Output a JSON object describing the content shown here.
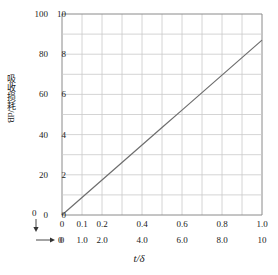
{
  "chart_data": {
    "type": "line",
    "title": "",
    "xlabel": "t/δ",
    "ylabel": "吸收损耗/dB",
    "grid": true,
    "legend": "none",
    "axes": {
      "y_primary": {
        "name": "吸收损耗/dB",
        "min": 0,
        "max": 100,
        "step": 20,
        "ticks": [
          "0",
          "20",
          "40",
          "60",
          "80",
          "100"
        ]
      },
      "y_secondary": {
        "min": 0,
        "max": 10,
        "step": 2,
        "ticks": [
          "0",
          "2",
          "4",
          "6",
          "8",
          "10"
        ]
      },
      "x_primary": {
        "min": 0,
        "max": 1.0,
        "ticks": [
          "0",
          "0.1",
          "0.2",
          "",
          "0.4",
          "",
          "0.6",
          "",
          "0.8",
          "",
          "1.0"
        ]
      },
      "x_secondary": {
        "min": 0,
        "max": 10,
        "ticks": [
          "0",
          "1.0",
          "2.0",
          "",
          "4.0",
          "",
          "6.0",
          "",
          "8.0",
          "",
          "10"
        ]
      }
    },
    "series": [
      {
        "name": "absorption-loss",
        "x": [
          0,
          0.1,
          0.2,
          0.3,
          0.4,
          0.5,
          0.6,
          0.7,
          0.8,
          0.9,
          1.0
        ],
        "values": [
          0,
          0.87,
          1.74,
          2.61,
          3.48,
          4.35,
          5.22,
          6.09,
          6.96,
          7.83,
          8.7
        ],
        "color": "#6e6e6e"
      }
    ],
    "origin_markers": {
      "y_zero": "0",
      "x_zero": "0"
    }
  },
  "style": {
    "grid_color": "#c9c9c9",
    "frame_color": "#8a8a8a",
    "line_color": "#6e6e6e",
    "text_color": "#222222",
    "background": "#ffffff"
  }
}
